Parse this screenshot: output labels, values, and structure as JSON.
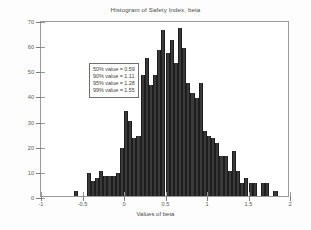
{
  "chart_data": {
    "type": "bar",
    "title": "Histogram of Safety Index, beta",
    "xlabel": "Values of beta",
    "ylabel": "Frequency",
    "xlim": [
      -1,
      2
    ],
    "ylim": [
      0,
      70
    ],
    "xticks": [
      -1,
      -0.5,
      0,
      0.5,
      1,
      1.5,
      2
    ],
    "xticklabels": [
      "-1",
      "-0.5",
      "0",
      "0.5",
      "1",
      "1.5",
      "2"
    ],
    "yticks": [
      0,
      10,
      20,
      30,
      40,
      50,
      60,
      70
    ],
    "yticklabels": [
      "0",
      "10",
      "20",
      "30",
      "40",
      "50",
      "60",
      "70"
    ],
    "grid": false,
    "legend": null,
    "bin_width": 0.05,
    "bar_color": "#3a3a3a",
    "bin_centers": [
      -0.575,
      -0.525,
      -0.475,
      -0.425,
      -0.375,
      -0.325,
      -0.275,
      -0.225,
      -0.175,
      -0.125,
      -0.075,
      -0.025,
      0.025,
      0.075,
      0.125,
      0.175,
      0.225,
      0.275,
      0.325,
      0.375,
      0.425,
      0.475,
      0.525,
      0.575,
      0.625,
      0.675,
      0.725,
      0.775,
      0.825,
      0.875,
      0.925,
      0.975,
      1.025,
      1.075,
      1.125,
      1.175,
      1.225,
      1.275,
      1.325,
      1.375,
      1.425,
      1.475,
      1.525,
      1.575,
      1.625,
      1.675,
      1.725,
      1.775,
      1.825,
      1.875
    ],
    "values": [
      2,
      0,
      0,
      9,
      6,
      7,
      10,
      8,
      8,
      8,
      9,
      19,
      34,
      30,
      23,
      24,
      48,
      55,
      44,
      48,
      58,
      66,
      57,
      62,
      53,
      67,
      59,
      45,
      41,
      39,
      45,
      26,
      24,
      23,
      21,
      16,
      16,
      10,
      18,
      10,
      5,
      7,
      5,
      5,
      0,
      5,
      5,
      0,
      2,
      0
    ]
  },
  "annotation": {
    "lines": [
      "50% value = 0.59",
      "90% value = 1.11",
      "95% value = 1.28",
      "99% value = 1.55"
    ]
  }
}
